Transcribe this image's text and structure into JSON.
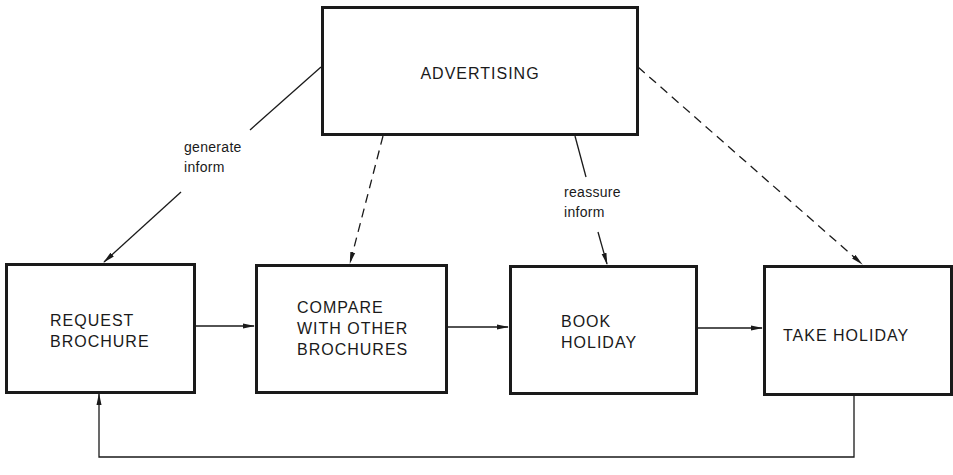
{
  "diagram": {
    "nodes": {
      "advertising": {
        "label": "ADVERTISING"
      },
      "request_brochure": {
        "label": "REQUEST\nBROCHURE"
      },
      "compare": {
        "label": "COMPARE\nWITH OTHER\nBROCHURES"
      },
      "book_holiday": {
        "label": "BOOK\nHOLIDAY"
      },
      "take_holiday": {
        "label": "TAKE HOLIDAY"
      }
    },
    "edge_labels": {
      "advertising_to_request": "generate\ninform",
      "advertising_to_book": "reassure\ninform"
    },
    "edges": [
      {
        "from": "ADVERTISING",
        "to": "REQUEST BROCHURE",
        "style": "solid",
        "label": "generate inform"
      },
      {
        "from": "ADVERTISING",
        "to": "COMPARE WITH OTHER BROCHURES",
        "style": "dashed"
      },
      {
        "from": "ADVERTISING",
        "to": "BOOK HOLIDAY",
        "style": "solid",
        "label": "reassure inform"
      },
      {
        "from": "ADVERTISING",
        "to": "TAKE HOLIDAY",
        "style": "dashed"
      },
      {
        "from": "REQUEST BROCHURE",
        "to": "COMPARE WITH OTHER BROCHURES",
        "style": "solid"
      },
      {
        "from": "COMPARE WITH OTHER BROCHURES",
        "to": "BOOK HOLIDAY",
        "style": "solid"
      },
      {
        "from": "BOOK HOLIDAY",
        "to": "TAKE HOLIDAY",
        "style": "solid"
      },
      {
        "from": "TAKE HOLIDAY",
        "to": "REQUEST BROCHURE",
        "style": "solid",
        "route": "feedback loop below"
      }
    ]
  }
}
